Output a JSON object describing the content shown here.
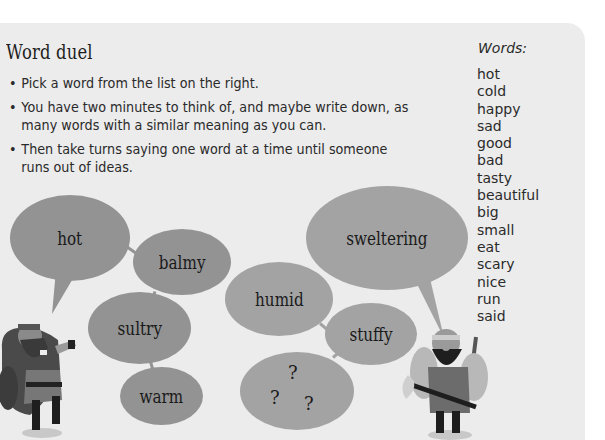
{
  "activity": {
    "title": "Word duel",
    "rules": [
      "Pick a word from the list on the right.",
      "You have two minutes to think of, and maybe write down, as many words with a similar meaning as you can.",
      "Then take turns saying one word at a time until someone runs out of ideas."
    ]
  },
  "word_list": {
    "heading": "Words:",
    "items": [
      "hot",
      "cold",
      "happy",
      "sad",
      "good",
      "bad",
      "tasty",
      "beautiful",
      "big",
      "small",
      "eat",
      "scary",
      "nice",
      "run",
      "said"
    ]
  },
  "bubbles": {
    "left_player": [
      "hot",
      "balmy",
      "sultry",
      "warm"
    ],
    "right_player": [
      "sweltering",
      "humid",
      "stuffy"
    ],
    "unknown": [
      "?",
      "?",
      "?"
    ]
  },
  "colors": {
    "card_bg": "#ececec",
    "bubble_dark": "#939393",
    "bubble_light": "#a3a3a3"
  }
}
